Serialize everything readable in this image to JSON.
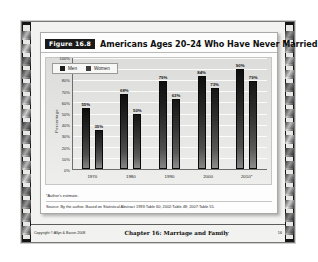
{
  "slide": {
    "figure_tag": "Figure 16.8",
    "title": "Americans Ages 20–24 Who Have Never Married",
    "notes": {
      "footnote": "*Author's estimate.",
      "source": "Source: By the author. Based on Statistical Abstract 1993:Table 60; 2002:Table 48; 2007:Table 55."
    },
    "footer": {
      "copyright": "Copyright © Allyn & Bacon 2008",
      "chapter": "Chapter 16: Marriage and Family",
      "page": "16"
    }
  },
  "chart_data": {
    "type": "bar",
    "title": "Americans Ages 20–24 Who Have Never Married",
    "xlabel": "",
    "ylabel": "Percentage",
    "categories": [
      "1970",
      "1980",
      "1990",
      "2000",
      "2010*"
    ],
    "series": [
      {
        "name": "Men",
        "color": "#1c1c1c",
        "values": [
          55,
          68,
          79,
          84,
          90
        ],
        "labels": [
          "55%",
          "68%",
          "79%",
          "84%",
          "90%"
        ]
      },
      {
        "name": "Women",
        "color": "#3c3c3c",
        "values": [
          35,
          50,
          63,
          73,
          79
        ],
        "labels": [
          "35%",
          "50%",
          "63%",
          "73%",
          "79%"
        ]
      }
    ],
    "ylim": [
      0,
      100
    ],
    "yticks": [
      100,
      90,
      80,
      70,
      60,
      50,
      40,
      30,
      20,
      10,
      0
    ],
    "ytick_labels": [
      "100%",
      "90%",
      "80%",
      "70%",
      "60%",
      "50%",
      "40%",
      "30%",
      "20%",
      "10%",
      "0%"
    ],
    "grid": true,
    "legend_position": "top-left"
  }
}
